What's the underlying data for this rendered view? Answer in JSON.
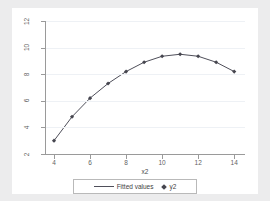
{
  "chart_data": {
    "type": "scatter",
    "title": "",
    "xlabel": "x2",
    "ylabel": "",
    "xlim": [
      3.5,
      14.6
    ],
    "ylim": [
      2,
      12
    ],
    "grid": true,
    "legend_position": "bottom",
    "x_ticks": [
      "4",
      "6",
      "8",
      "10",
      "12",
      "14"
    ],
    "x_tick_values": [
      4,
      6,
      8,
      10,
      12,
      14
    ],
    "y_ticks": [
      "2",
      "4",
      "6",
      "8",
      "10",
      "12"
    ],
    "y_tick_values": [
      2,
      4,
      6,
      8,
      10,
      12
    ],
    "x": [
      4,
      5,
      6,
      7,
      8,
      9,
      10,
      11,
      12,
      13,
      14
    ],
    "series": [
      {
        "name": "Fitted values",
        "kind": "line",
        "color": "#4f4f5a",
        "values": [
          3.0,
          4.8,
          6.2,
          7.3,
          8.2,
          8.9,
          9.35,
          9.5,
          9.35,
          8.9,
          8.2
        ]
      },
      {
        "name": "y2",
        "kind": "marker",
        "color": "#46464f",
        "values": [
          3.0,
          4.8,
          6.2,
          7.3,
          8.2,
          8.9,
          9.35,
          9.5,
          9.35,
          8.9,
          8.2
        ]
      }
    ],
    "legend": [
      {
        "label": "Fitted values",
        "marker": "line-swatch"
      },
      {
        "label": "y2",
        "marker": "diamond-marker"
      }
    ]
  },
  "colors": {
    "page_background": "#ececed",
    "graph_background": "#ffffff",
    "gridline": "#eef1f5",
    "axis": "#9a9a9a",
    "tick_label": "#5f5f5f",
    "line": "#4f4f5a",
    "marker": "#46464f",
    "legend_border": "#b9b9b9"
  }
}
